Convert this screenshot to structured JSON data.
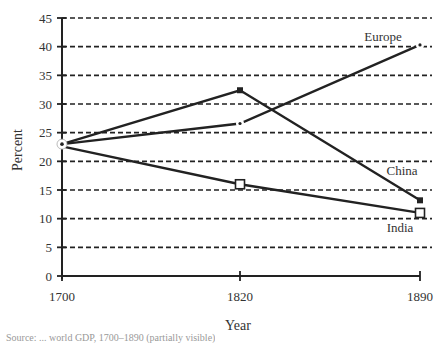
{
  "chart_data": {
    "type": "line",
    "title": "",
    "xlabel": "Year",
    "ylabel": "Percent",
    "x": [
      "1700",
      "1820",
      "1890"
    ],
    "ylim": [
      0,
      45
    ],
    "yticks": [
      0,
      5,
      10,
      15,
      20,
      25,
      30,
      35,
      40,
      45
    ],
    "grid": "horizontal dashed",
    "legend": "inline labels near line ends",
    "series": [
      {
        "name": "Europe",
        "values": [
          23.0,
          26.6,
          40.3
        ],
        "marker": "small-dot"
      },
      {
        "name": "China",
        "values": [
          23.0,
          32.4,
          13.2
        ],
        "marker": "filled-square"
      },
      {
        "name": "India",
        "values": [
          22.6,
          16.0,
          11.0
        ],
        "marker": "open-square"
      }
    ]
  },
  "labels": {
    "xlabel": "Year",
    "ylabel": "Percent",
    "europe": "Europe",
    "china": "China",
    "india": "India",
    "yticks": [
      "0",
      "5",
      "10",
      "15",
      "20",
      "25",
      "30",
      "35",
      "40",
      "45"
    ],
    "xticks": [
      "1700",
      "1820",
      "1890"
    ]
  },
  "caption": "Source: ... world GDP, 1700–1890 (partially visible)",
  "colors": {
    "line": "#222222",
    "grid": "#222222",
    "text": "#333333"
  }
}
